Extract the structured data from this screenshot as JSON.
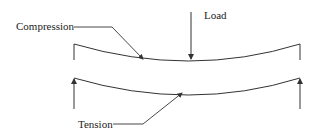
{
  "diagram": {
    "type": "beam-bending",
    "labels": {
      "compression": "Compression",
      "load": "Load",
      "tension": "Tension"
    },
    "colors": {
      "stroke": "#333333",
      "text": "#222222",
      "background": "#ffffff"
    }
  }
}
